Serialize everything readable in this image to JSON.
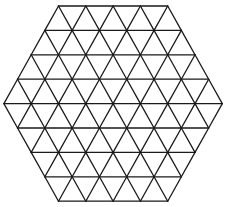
{
  "diagram": {
    "shape": "hexagon",
    "subdivision": "equilateral-triangle-grid",
    "side_units": 4,
    "rows": 8,
    "stroke_color": "#1a1a1a",
    "background_color": "#ffffff",
    "geometry": {
      "center_x": 113.1,
      "top_y": 6,
      "unit": 27.3,
      "row_height": 24.4
    }
  }
}
